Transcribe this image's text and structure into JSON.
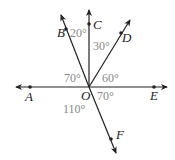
{
  "diagram": {
    "type": "angles-at-point",
    "center": {
      "label": "O",
      "x": 89,
      "y": 87
    },
    "points": [
      {
        "label": "A",
        "x": 30,
        "y": 88
      },
      {
        "label": "B",
        "x": 66,
        "y": 29
      },
      {
        "label": "C",
        "x": 89,
        "y": 24
      },
      {
        "label": "D",
        "x": 121,
        "y": 33
      },
      {
        "label": "E",
        "x": 154,
        "y": 87
      },
      {
        "label": "F",
        "x": 111,
        "y": 139
      }
    ],
    "angles": [
      {
        "between": "BOC",
        "label": "20°"
      },
      {
        "between": "COD",
        "label": "30°"
      },
      {
        "between": "AOB",
        "label": "70°"
      },
      {
        "between": "DOE",
        "label": "60°"
      },
      {
        "between": "EOF",
        "label": "70°"
      },
      {
        "between": "AOF",
        "label": "110°"
      }
    ],
    "colors": {
      "line": "#222222",
      "angle_text": "#888888"
    }
  }
}
